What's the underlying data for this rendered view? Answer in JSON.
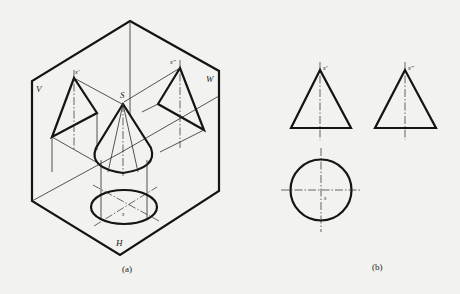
{
  "figure": {
    "type": "technical-drawing"
  },
  "panel_a": {
    "caption": "(a)",
    "plane_labels": {
      "V": "V",
      "W": "W",
      "H": "H"
    },
    "point_labels": {
      "apex_3d": "S",
      "apex_v": "s'",
      "apex_w": "s''",
      "apex_h": "s"
    }
  },
  "panel_b": {
    "caption": "(b)",
    "point_labels": {
      "apex_v": "s'",
      "apex_w": "s''",
      "apex_h": "s"
    },
    "views": [
      "front-view-triangle",
      "side-view-triangle",
      "top-view-circle"
    ]
  },
  "colors": {
    "background": "#f2f2f0",
    "ink": "#141414"
  }
}
